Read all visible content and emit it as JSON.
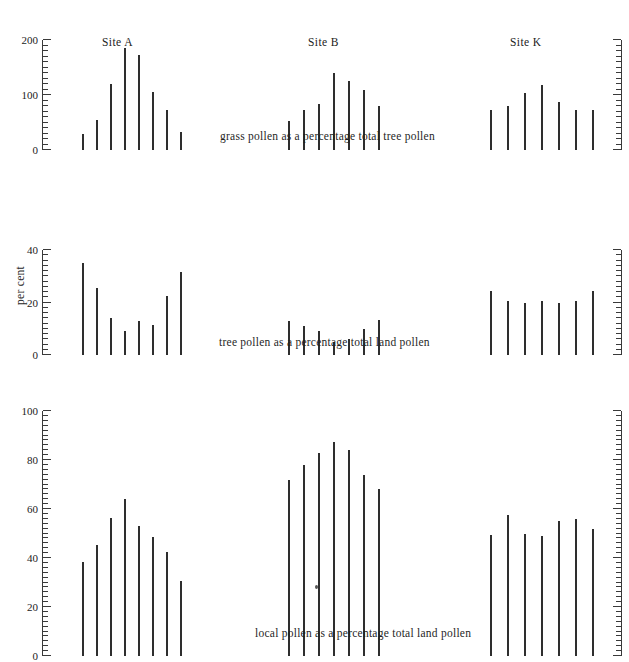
{
  "figure": {
    "axis_title": "per cent",
    "site_titles": [
      "Site A",
      "Site B",
      "Site K"
    ],
    "captions": [
      "grass pollen as a percentage total tree pollen",
      "tree pollen as a percentage total land pollen",
      "local pollen as a percentage total land pollen"
    ],
    "ink_color": "#2e2e2e",
    "background_color": "#ffffff"
  },
  "chart_data": [
    {
      "type": "bar",
      "title": "Site A",
      "subtitle": "grass pollen as a percentage total tree pollen",
      "xlabel": "",
      "ylabel": "per cent",
      "ylim": [
        0,
        200
      ],
      "yticks": [
        0,
        100,
        200
      ],
      "ytick_labels": [
        "0",
        "100",
        "200"
      ],
      "minor_tick_interval": 10,
      "grid": false,
      "legend": "none",
      "axis_side": "left",
      "categories": [
        "1",
        "2",
        "3",
        "4",
        "5",
        "6",
        "7",
        "8"
      ],
      "values": [
        30,
        55,
        120,
        185,
        172,
        105,
        72,
        33
      ]
    },
    {
      "type": "bar",
      "title": "Site B",
      "subtitle": "grass pollen as a percentage total tree pollen",
      "xlabel": "",
      "ylabel": "per cent",
      "ylim": [
        0,
        200
      ],
      "yticks": [
        0,
        100,
        200
      ],
      "ytick_labels": [
        "",
        "",
        ""
      ],
      "minor_tick_interval": 10,
      "grid": false,
      "legend": "none",
      "axis_side": "none",
      "categories": [
        "1",
        "2",
        "3",
        "4",
        "5",
        "6",
        "7"
      ],
      "values": [
        52,
        72,
        83,
        140,
        125,
        110,
        80
      ]
    },
    {
      "type": "bar",
      "title": "Site K",
      "subtitle": "grass pollen as a percentage total tree pollen",
      "xlabel": "",
      "ylabel": "per cent",
      "ylim": [
        0,
        200
      ],
      "yticks": [
        0,
        100,
        200
      ],
      "ytick_labels": [
        "",
        "",
        ""
      ],
      "minor_tick_interval": 10,
      "grid": false,
      "legend": "none",
      "axis_side": "right",
      "categories": [
        "1",
        "2",
        "3",
        "4",
        "5",
        "6",
        "7"
      ],
      "values": [
        72,
        80,
        104,
        118,
        88,
        72,
        73
      ]
    },
    {
      "type": "bar",
      "title": "Site A",
      "subtitle": "tree pollen as a percentage total land pollen",
      "xlabel": "",
      "ylabel": "per cent",
      "ylim": [
        0,
        40
      ],
      "yticks": [
        0,
        20,
        40
      ],
      "ytick_labels": [
        "0",
        "20",
        "40"
      ],
      "minor_tick_interval": 2,
      "grid": false,
      "legend": "none",
      "axis_side": "left",
      "categories": [
        "1",
        "2",
        "3",
        "4",
        "5",
        "6",
        "7",
        "8"
      ],
      "values": [
        35,
        25.5,
        14,
        9,
        13,
        11.5,
        22.5,
        31.5
      ]
    },
    {
      "type": "bar",
      "title": "Site B",
      "subtitle": "tree pollen as a percentage total land pollen",
      "xlabel": "",
      "ylabel": "per cent",
      "ylim": [
        0,
        40
      ],
      "yticks": [
        0,
        20,
        40
      ],
      "ytick_labels": [
        "",
        "",
        ""
      ],
      "minor_tick_interval": 2,
      "grid": false,
      "legend": "none",
      "axis_side": "none",
      "categories": [
        "1",
        "2",
        "3",
        "4",
        "5",
        "6",
        "7"
      ],
      "values": [
        13,
        11,
        9,
        5,
        6,
        10,
        13.5
      ]
    },
    {
      "type": "bar",
      "title": "Site K",
      "subtitle": "tree pollen as a percentage total land pollen",
      "xlabel": "",
      "ylabel": "per cent",
      "ylim": [
        0,
        40
      ],
      "yticks": [
        0,
        20,
        40
      ],
      "ytick_labels": [
        "",
        "",
        ""
      ],
      "minor_tick_interval": 2,
      "grid": false,
      "legend": "none",
      "axis_side": "right",
      "categories": [
        "1",
        "2",
        "3",
        "4",
        "5",
        "6",
        "7"
      ],
      "values": [
        24.5,
        20.5,
        20,
        20.5,
        20,
        20.5,
        24.5
      ]
    },
    {
      "type": "bar",
      "title": "Site A",
      "subtitle": "local pollen as a percentage total land pollen",
      "xlabel": "",
      "ylabel": "per cent",
      "ylim": [
        0,
        100
      ],
      "yticks": [
        0,
        20,
        40,
        60,
        80,
        100
      ],
      "ytick_labels": [
        "0",
        "20",
        "40",
        "60",
        "80",
        "100"
      ],
      "minor_tick_interval": 2,
      "grid": false,
      "legend": "none",
      "axis_side": "left",
      "categories": [
        "1",
        "2",
        "3",
        "4",
        "5",
        "6",
        "7",
        "8"
      ],
      "values": [
        38.5,
        45.5,
        56.5,
        64,
        53,
        48.5,
        42.5,
        30.5
      ]
    },
    {
      "type": "bar",
      "title": "Site B",
      "subtitle": "local pollen as a percentage total land pollen",
      "xlabel": "",
      "ylabel": "per cent",
      "ylim": [
        0,
        100
      ],
      "yticks": [
        0,
        20,
        40,
        60,
        80,
        100
      ],
      "ytick_labels": [
        "",
        "",
        "",
        "",
        "",
        ""
      ],
      "minor_tick_interval": 2,
      "grid": false,
      "legend": "none",
      "axis_side": "none",
      "categories": [
        "1",
        "2",
        "3",
        "4",
        "5",
        "6",
        "7"
      ],
      "values": [
        72,
        78,
        83,
        87.5,
        84,
        74,
        68
      ]
    },
    {
      "type": "bar",
      "title": "Site K",
      "subtitle": "local pollen as a percentage total land pollen",
      "xlabel": "",
      "ylabel": "per cent",
      "ylim": [
        0,
        100
      ],
      "yticks": [
        0,
        20,
        40,
        60,
        80,
        100
      ],
      "ytick_labels": [
        "",
        "",
        "",
        "",
        "",
        ""
      ],
      "minor_tick_interval": 2,
      "grid": false,
      "legend": "none",
      "axis_side": "right",
      "categories": [
        "1",
        "2",
        "3",
        "4",
        "5",
        "6",
        "7"
      ],
      "values": [
        49.5,
        57.5,
        50,
        49,
        55,
        56,
        52
      ]
    }
  ],
  "layout": {
    "rows": [
      {
        "plot_height": 110,
        "axis_height": 110,
        "title_top": 4,
        "caption_top": 128
      },
      {
        "plot_height": 105,
        "axis_height": 105,
        "title_top": 0,
        "caption_top": 128
      },
      {
        "plot_height": 245,
        "axis_height": 245,
        "title_top": 0,
        "caption_top": 258
      }
    ],
    "columns": [
      {
        "axis_x": 42,
        "bars_x": 82,
        "bar_gap": 14
      },
      {
        "axis_x": 0,
        "bars_x": 288,
        "bar_gap": 15
      },
      {
        "axis_x": 612,
        "bars_x": 490,
        "bar_gap": 17
      }
    ],
    "caption_left": [
      220,
      219,
      255
    ]
  }
}
